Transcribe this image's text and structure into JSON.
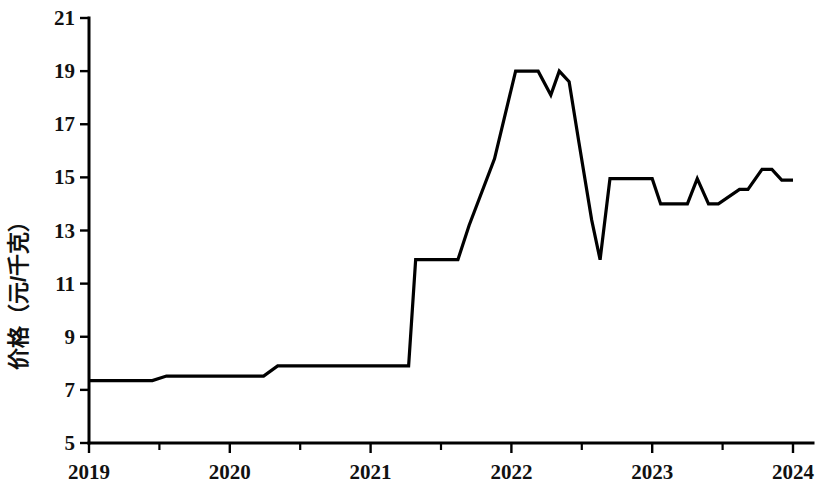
{
  "chart_data": {
    "type": "line",
    "title": "",
    "xlabel": "",
    "ylabel": "价格（元/千克）",
    "xlim": [
      2019,
      2024
    ],
    "ylim": [
      5,
      21
    ],
    "grid": false,
    "legend": null,
    "yticks": [
      5,
      7,
      9,
      11,
      13,
      15,
      17,
      19,
      21
    ],
    "ytick_labels": [
      "5",
      "7",
      "9",
      "11",
      "13",
      "15",
      "17",
      "19",
      "21"
    ],
    "xticks": [
      2019,
      2020,
      2021,
      2022,
      2023,
      2024
    ],
    "xtick_labels": [
      "2019",
      "2020",
      "2021",
      "2022",
      "2023",
      "2024"
    ],
    "x_minor_ticks": [
      2019.5,
      2020.5,
      2021.5,
      2022.5,
      2023.5
    ],
    "series": [
      {
        "name": "价格",
        "color": "#000000",
        "x": [
          2019.0,
          2019.45,
          2019.55,
          2020.24,
          2020.34,
          2021.27,
          2021.32,
          2021.62,
          2021.7,
          2021.88,
          2022.03,
          2022.19,
          2022.28,
          2022.34,
          2022.41,
          2022.48,
          2022.57,
          2022.63,
          2022.7,
          2022.8,
          2023.0,
          2023.06,
          2023.25,
          2023.32,
          2023.4,
          2023.47,
          2023.62,
          2023.68,
          2023.78,
          2023.85,
          2023.92,
          2024.0
        ],
        "y": [
          7.35,
          7.35,
          7.52,
          7.52,
          7.9,
          7.9,
          11.9,
          11.9,
          13.2,
          15.7,
          19.0,
          19.0,
          18.1,
          19.0,
          18.6,
          16.3,
          13.4,
          11.9,
          14.95,
          14.95,
          14.95,
          14.0,
          14.0,
          14.95,
          14.0,
          14.0,
          14.55,
          14.55,
          15.3,
          15.3,
          14.9,
          14.9
        ]
      }
    ],
    "annotations": []
  },
  "axes": {
    "y_axis_name": "y-axis",
    "x_axis_name": "x-axis"
  }
}
